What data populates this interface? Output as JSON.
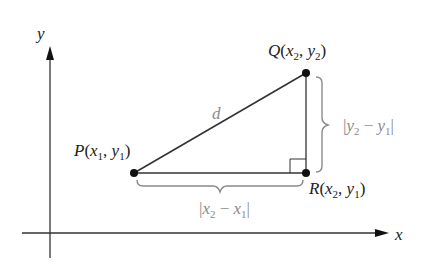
{
  "diagram": {
    "type": "distance-formula",
    "axes": {
      "x_label": "x",
      "y_label": "y"
    },
    "points": {
      "P": {
        "name": "P",
        "coords_label": "(x1, y1)",
        "x_sub": "1",
        "y_sub": "1",
        "xvar": "x",
        "yvar": "y"
      },
      "Q": {
        "name": "Q",
        "coords_label": "(x2, y2)",
        "x_sub": "2",
        "y_sub": "2",
        "xvar": "x",
        "yvar": "y"
      },
      "R": {
        "name": "R",
        "coords_label": "(x2, y1)",
        "x_sub": "2",
        "y_sub": "1",
        "xvar": "x",
        "yvar": "y"
      }
    },
    "hypotenuse_label": "d",
    "horizontal_brace_label": "|x2 − x1|",
    "vertical_brace_label": "|y2 − y1|",
    "right_angle_at": "R",
    "colors": {
      "line": "#333333",
      "point": "#111111",
      "brace": "#8a8a8a",
      "label": "#222222",
      "grey_label": "#8a8a8a"
    },
    "parts": {
      "open": "(",
      "comma": ", ",
      "close": ")",
      "bar": "|",
      "minus": " − ",
      "one": "1",
      "two": "2",
      "x": "x",
      "y": "y"
    }
  }
}
